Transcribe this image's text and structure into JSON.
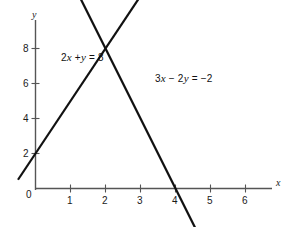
{
  "figure": {
    "background_color": "#ffffff",
    "line_color": "#111111",
    "axis_color": "#555555",
    "text_color": "#1a1a1a"
  },
  "axes": {
    "x_axis_name": "x",
    "y_axis_name": "y",
    "origin_label": "0",
    "x_ticks": [
      "1",
      "2",
      "3",
      "4",
      "5",
      "6"
    ],
    "y_ticks": [
      "2",
      "4",
      "6",
      "8"
    ]
  },
  "annotations": {
    "line1_label_prefix": "2",
    "line1_label_var1": "x",
    "line1_label_mid": " +",
    "line1_label_var2": "y",
    "line1_label_suffix": " = 8",
    "line2_label_prefix": "3",
    "line2_label_var1": "x",
    "line2_label_mid": " − 2",
    "line2_label_var2": "y",
    "line2_label_suffix": " = −2"
  },
  "chart_data": {
    "type": "line",
    "title": "",
    "xlabel": "x",
    "ylabel": "y",
    "xlim": [
      -0.55,
      7.0
    ],
    "ylim": [
      -0.9,
      9.4
    ],
    "grid": false,
    "legend": "inline-annotations",
    "x_ticks": [
      1,
      2,
      3,
      4,
      5,
      6
    ],
    "y_ticks": [
      2,
      4,
      6,
      8
    ],
    "intersection": [
      2,
      4
    ],
    "series": [
      {
        "name": "2x + y = 8",
        "label": "2x + y = 8",
        "slope": -2,
        "intercept": 8,
        "x_intercept": 4,
        "y_intercept": 8,
        "draw_from": [
          -0.5,
          9.0
        ],
        "draw_to": [
          4.85,
          -1.7
        ],
        "points": [
          [
            -0.5,
            9.0
          ],
          [
            0,
            8
          ],
          [
            2,
            4
          ],
          [
            4,
            0
          ],
          [
            4.85,
            -1.7
          ]
        ]
      },
      {
        "name": "3x - 2y = -2",
        "label": "3x − 2y = −2",
        "slope": 1.5,
        "intercept": 1,
        "x_intercept": -0.6667,
        "y_intercept": 1,
        "draw_from": [
          -0.5,
          0.25
        ],
        "draw_to": [
          5.0,
          8.5
        ],
        "points": [
          [
            -0.5,
            0.25
          ],
          [
            0,
            1
          ],
          [
            2,
            4
          ],
          [
            5.0,
            8.5
          ]
        ]
      }
    ]
  }
}
